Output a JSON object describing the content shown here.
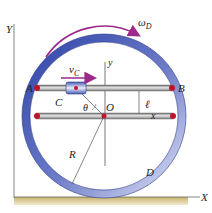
{
  "diagram": {
    "type": "mechanics-figure",
    "labels": {
      "Y": "Y",
      "X": "X",
      "y": "y",
      "A": "A",
      "B": "B",
      "C": "C",
      "O": "O",
      "D": "D",
      "R": "R",
      "x": "x",
      "ell": "ℓ",
      "theta": "θ",
      "omega_D_sym": "ω",
      "omega_D_sub": "D",
      "v_C_sym": "v",
      "v_C_sub": "C"
    },
    "colors": {
      "ring": "#4a5cb5",
      "ring_light": "#c8cfee",
      "arrow": "#9b2a8a",
      "pin": "#c0142a",
      "rod": "#8a8a8a",
      "ground": "#d9c890",
      "axis": "#555555"
    }
  }
}
